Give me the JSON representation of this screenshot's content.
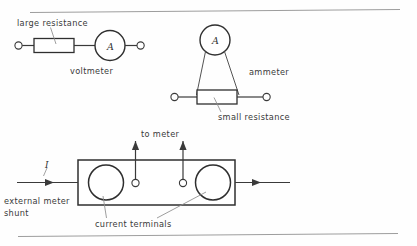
{
  "figure": {
    "background_color": "#fefefe",
    "ink_color": "#3a3a3a",
    "rule_color": "#9a9a9a"
  },
  "rules": {
    "top_label": "top-divider-rule",
    "bottom_label": "bottom-divider-rule"
  },
  "voltmeter_circuit": {
    "resistance_label": "large resistance",
    "meter_symbol": "A",
    "meter_label": "voltmeter"
  },
  "ammeter_circuit": {
    "meter_symbol": "A",
    "meter_label": "ammeter",
    "resistance_label": "small resistance"
  },
  "shunt_circuit": {
    "to_meter_label": "to meter",
    "current_symbol": "I",
    "shunt_label_line1": "external meter",
    "shunt_label_line2": "shunt",
    "terminals_label": "current terminals"
  }
}
